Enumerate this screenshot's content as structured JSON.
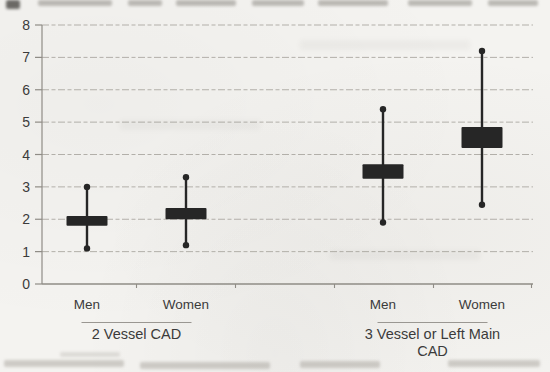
{
  "figure": {
    "paper_color": "#f4f3f0"
  },
  "chart_data": {
    "type": "boxplot",
    "title": "",
    "xlabel": "",
    "ylabel": "",
    "ylim": [
      0,
      8
    ],
    "yticks": [
      0,
      1,
      2,
      3,
      4,
      5,
      6,
      7,
      8
    ],
    "grid": true,
    "legend": "none",
    "marker_style": "thick filled box with vertical whisker line and round dot caps",
    "groups": [
      {
        "label": "2 Vessel CAD",
        "label_lines": [
          "2 Vessel CAD"
        ],
        "series": [
          {
            "label": "Men",
            "box_low": 1.8,
            "box_high": 2.1,
            "center": 1.95,
            "whisker_low": 1.1,
            "whisker_high": 3.0
          },
          {
            "label": "Women",
            "box_low": 2.0,
            "box_high": 2.35,
            "center": 2.18,
            "whisker_low": 1.2,
            "whisker_high": 3.3
          }
        ]
      },
      {
        "label": "3 Vessel or Left Main CAD",
        "label_lines": [
          "3 Vessel or Left Main",
          "CAD"
        ],
        "series": [
          {
            "label": "Men",
            "box_low": 3.25,
            "box_high": 3.7,
            "center": 3.5,
            "whisker_low": 1.9,
            "whisker_high": 5.4
          },
          {
            "label": "Women",
            "box_low": 4.2,
            "box_high": 4.85,
            "center": 4.5,
            "whisker_low": 2.45,
            "whisker_high": 7.2
          }
        ]
      }
    ],
    "colors": {
      "box": "#262626",
      "grid": "#b2afa9",
      "axis": "#8f8c86",
      "underline": "#9a9792",
      "text": "#3b3b3b"
    }
  }
}
